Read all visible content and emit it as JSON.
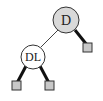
{
  "diagram": {
    "type": "binary-tree",
    "colors": {
      "internal_stroke": "#333333",
      "root_fill": "#d9d9d9",
      "child_fill": "#ffffff",
      "leaf_fill": "#c8c8c8",
      "leaf_stroke": "#333333",
      "thin_edge": "#444444",
      "thick_edge": "#111111"
    },
    "nodes": [
      {
        "id": "D",
        "label": "D",
        "kind": "internal",
        "shaded": true
      },
      {
        "id": "DL",
        "label": "DL",
        "kind": "internal",
        "shaded": false
      },
      {
        "id": "leaf-1",
        "label": "",
        "kind": "leaf"
      },
      {
        "id": "leaf-2",
        "label": "",
        "kind": "leaf"
      },
      {
        "id": "leaf-3",
        "label": "",
        "kind": "leaf"
      }
    ],
    "edges": [
      {
        "from": "D",
        "to": "DL",
        "style": "thin"
      },
      {
        "from": "D",
        "to": "leaf-1",
        "style": "thick"
      },
      {
        "from": "DL",
        "to": "leaf-2",
        "style": "thick"
      },
      {
        "from": "DL",
        "to": "leaf-3",
        "style": "thick"
      }
    ]
  }
}
